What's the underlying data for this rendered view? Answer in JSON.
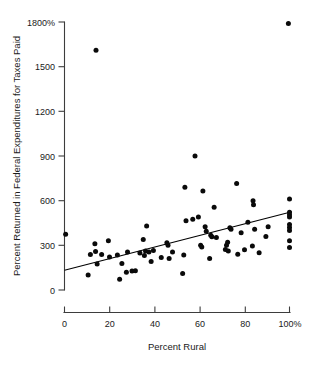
{
  "chart_data": {
    "type": "scatter",
    "title": "",
    "xlabel": "Percent Rural",
    "ylabel": "Percent Returned in Federal Expenditures for Taxes Paid",
    "xlim": [
      0,
      100
    ],
    "ylim": [
      0,
      1800
    ],
    "grid": false,
    "legend": null,
    "xticks": [
      0,
      20,
      40,
      60,
      80,
      100
    ],
    "xtick_labels": [
      "0",
      "20",
      "40",
      "60",
      "80",
      "100%"
    ],
    "yticks": [
      0,
      300,
      600,
      900,
      1200,
      1500,
      1800
    ],
    "ytick_labels": [
      "0",
      "300",
      "600",
      "900",
      "1200",
      "1500",
      "1800%"
    ],
    "series": [
      {
        "name": "states",
        "marker": "filled-circle",
        "color": "#0a0a0a",
        "points": [
          [
            0.5,
            375
          ],
          [
            10.5,
            100
          ],
          [
            11.5,
            238
          ],
          [
            13.5,
            310
          ],
          [
            13.8,
            258
          ],
          [
            14.0,
            1610
          ],
          [
            14.5,
            175
          ],
          [
            16.5,
            238
          ],
          [
            19.5,
            330
          ],
          [
            20.0,
            222
          ],
          [
            23.5,
            235
          ],
          [
            24.5,
            72
          ],
          [
            25.5,
            178
          ],
          [
            27.5,
            120
          ],
          [
            28.0,
            255
          ],
          [
            30.0,
            128
          ],
          [
            31.5,
            130
          ],
          [
            33.5,
            248
          ],
          [
            35.0,
            340
          ],
          [
            35.5,
            232
          ],
          [
            36.0,
            262
          ],
          [
            36.5,
            430
          ],
          [
            37.5,
            255
          ],
          [
            38.5,
            192
          ],
          [
            39.5,
            265
          ],
          [
            43.0,
            218
          ],
          [
            45.5,
            318
          ],
          [
            46.0,
            300
          ],
          [
            46.5,
            212
          ],
          [
            48.0,
            255
          ],
          [
            52.5,
            110
          ],
          [
            53.0,
            235
          ],
          [
            53.5,
            690
          ],
          [
            54.0,
            465
          ],
          [
            57.0,
            475
          ],
          [
            58.0,
            900
          ],
          [
            59.5,
            490
          ],
          [
            60.5,
            300
          ],
          [
            61.0,
            288
          ],
          [
            61.5,
            665
          ],
          [
            62.5,
            425
          ],
          [
            63.0,
            395
          ],
          [
            64.5,
            212
          ],
          [
            65.0,
            368
          ],
          [
            65.5,
            358
          ],
          [
            66.5,
            555
          ],
          [
            67.5,
            352
          ],
          [
            71.5,
            272
          ],
          [
            72.0,
            300
          ],
          [
            72.5,
            320
          ],
          [
            72.8,
            262
          ],
          [
            73.5,
            418
          ],
          [
            74.0,
            408
          ],
          [
            76.5,
            715
          ],
          [
            77.0,
            240
          ],
          [
            78.5,
            385
          ],
          [
            80.0,
            270
          ],
          [
            81.5,
            455
          ],
          [
            83.5,
            295
          ],
          [
            83.8,
            600
          ],
          [
            84.0,
            572
          ],
          [
            84.5,
            408
          ],
          [
            86.5,
            250
          ],
          [
            89.5,
            360
          ],
          [
            90.5,
            425
          ],
          [
            99.5,
            1790
          ],
          [
            100.0,
            612
          ],
          [
            100.0,
            522
          ],
          [
            100.0,
            505
          ],
          [
            100.0,
            490
          ],
          [
            100.0,
            440
          ],
          [
            100.0,
            420
          ],
          [
            100.0,
            400
          ],
          [
            100.0,
            330
          ],
          [
            100.0,
            285
          ]
        ]
      }
    ],
    "fit_line": {
      "name": "regression-line",
      "color": "#000000",
      "x_start": 0,
      "y_start": 133,
      "x_end": 101,
      "y_end": 525
    }
  }
}
